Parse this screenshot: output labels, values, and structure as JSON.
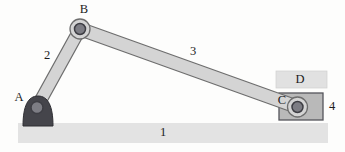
{
  "figure": {
    "labels": {
      "ground_link": "1",
      "crank_link": "2",
      "coupler_link": "3",
      "slider_block": "4",
      "joint_a": "A",
      "joint_b": "B",
      "joint_c": "C",
      "slider_guide": "D"
    },
    "colors": {
      "background": "#fdfdfc",
      "ground_fill": "#e3e3e3",
      "guide_fill": "#e1e1e1",
      "guide_stroke": "#d2d2d2",
      "link_fill": "#d4d4d4",
      "link_stroke": "#6e6e6e",
      "pivot_base_fill": "#45454b",
      "pivot_base_stroke": "#2e2e33",
      "pin_fill": "#7d7d84",
      "pin_stroke": "#3e3e44",
      "slider_fill": "#b9b9b9",
      "slider_stroke": "#55555b",
      "label_color": "#1c1c1c"
    }
  }
}
